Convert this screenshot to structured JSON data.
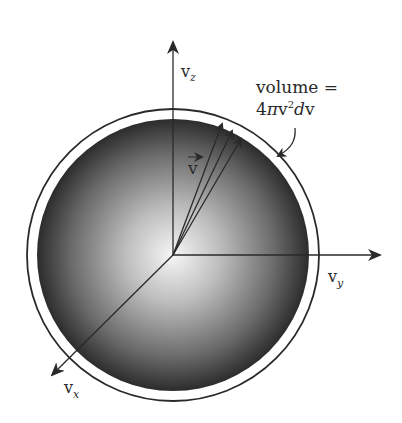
{
  "diagram": {
    "center": [
      173,
      255
    ],
    "sphere_radius": 136,
    "shell_outer_radius": 146,
    "colors": {
      "sphere_center": "#f4f4f4",
      "sphere_edge": "#2e2e2e",
      "lines": "#2a2a2a",
      "background": "#ffffff"
    },
    "axes": {
      "vz": {
        "label": "v",
        "subscript": "z"
      },
      "vy": {
        "label": "v",
        "subscript": "y"
      },
      "vx": {
        "label": "v",
        "subscript": "x"
      }
    },
    "vector_label": "v",
    "annotation": {
      "line1": "volume =",
      "line2_prefix": "4",
      "line2_pi": "π",
      "line2_v": "v",
      "line2_exp": "2",
      "line2_d": "d",
      "line2_tail": "v"
    }
  }
}
